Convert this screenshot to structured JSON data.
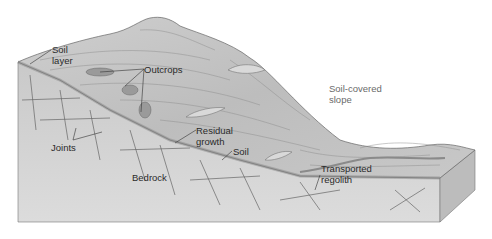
{
  "diagram": {
    "type": "geologic-block-diagram",
    "colors": {
      "background": "#ffffff",
      "surface": "#c9c9c9",
      "surface_dark": "#a8a8a8",
      "front_face": "#d4d4d4",
      "side_face": "#bdbdbd",
      "lines": "#555555",
      "label_text": "#2a2a2a",
      "label_text_light": "#6a6a6a"
    },
    "labels": [
      {
        "id": "soil-layer",
        "text": "Soil\nlayer",
        "x": 52,
        "y": 44
      },
      {
        "id": "outcrops",
        "text": "Outcrops",
        "x": 144,
        "y": 64
      },
      {
        "id": "joints",
        "text": "Joints",
        "x": 51,
        "y": 142
      },
      {
        "id": "residual-growth",
        "text": "Residual\ngrowth",
        "x": 196,
        "y": 125
      },
      {
        "id": "soil",
        "text": "Soil",
        "x": 233,
        "y": 146
      },
      {
        "id": "bedrock",
        "text": "Bedrock",
        "x": 132,
        "y": 172
      },
      {
        "id": "soil-covered-slope",
        "text": "Soil-covered\nslope",
        "x": 329,
        "y": 83
      },
      {
        "id": "transported-regolith",
        "text": "Transported\nregolith",
        "x": 321,
        "y": 163
      }
    ]
  }
}
